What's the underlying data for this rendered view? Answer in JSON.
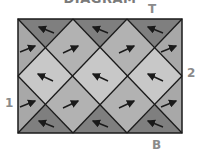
{
  "title": "DIAGRAM",
  "labels": {
    "top": "T",
    "bottom": "B",
    "left": "1",
    "right": "2"
  },
  "colors": {
    "dark": "#7f7f7f",
    "mid": "#a8a8a8",
    "light": "#c8c8c8",
    "line": "#1a1a1a",
    "label": "#8a8a8a"
  }
}
